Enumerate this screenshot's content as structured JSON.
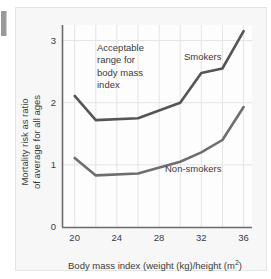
{
  "chart_data": {
    "type": "line",
    "title": "",
    "xlabel": "Body mass index (weight (kg)/height (m²))",
    "ylabel": "Mortality risk as ratio of average for all ages",
    "ylabel_line1": "Mortality risk as ratio",
    "ylabel_line2": "of average for all ages",
    "xlabel_main": "Body mass index (weight (kg)/height (m",
    "xlabel_sup": "2",
    "xlabel_tail": ")",
    "x": [
      20,
      22,
      26,
      30,
      32,
      34,
      36
    ],
    "xlim": [
      18.8,
      36.8
    ],
    "ylim": [
      0,
      3.25
    ],
    "xticks": [
      "20",
      "24",
      "28",
      "32",
      "36"
    ],
    "xtick_values": [
      20,
      24,
      28,
      32,
      36
    ],
    "yticks": [
      "0",
      "1",
      "2",
      "3"
    ],
    "ytick_values": [
      0,
      1,
      2,
      3
    ],
    "grid": true,
    "grid_x_step": 2,
    "legend": "inline-labels",
    "series": [
      {
        "name": "Smokers",
        "color": "#555555",
        "values": [
          2.11,
          1.72,
          1.75,
          2.0,
          2.48,
          2.55,
          3.15
        ]
      },
      {
        "name": "Non-smokers",
        "color": "#6e6e6e",
        "values": [
          1.11,
          0.83,
          0.86,
          1.05,
          1.2,
          1.4,
          1.93
        ]
      }
    ],
    "annotations": [
      {
        "id": "acceptable-range",
        "lines": [
          "Acceptable",
          "range for",
          "body mass",
          "index"
        ]
      }
    ]
  },
  "colors": {
    "figure_background": "#f7f7f7",
    "page_background": "#ffffff",
    "axis": "#6b6b6b",
    "grid": "#e0e0e0",
    "text": "#3b3b3b",
    "smokers_line": "#555555",
    "nonsmokers_line": "#6e6e6e"
  }
}
